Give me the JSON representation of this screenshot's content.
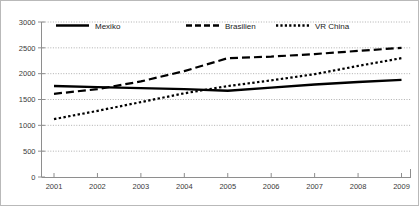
{
  "chart_data": {
    "type": "line",
    "title": "",
    "xlabel": "",
    "ylabel": "",
    "categories": [
      "2001",
      "2002",
      "2003",
      "2004",
      "2005",
      "2006",
      "2007",
      "2008",
      "2009"
    ],
    "x_tick_labels": [
      "2001",
      "2002",
      "2003",
      "2004",
      "2005",
      "2006",
      "2007",
      "2008",
      "2009"
    ],
    "y_tick_labels": [
      "0",
      "500",
      "1000",
      "1500",
      "2000",
      "2500",
      "3000"
    ],
    "y_ticks": [
      0,
      500,
      1000,
      1500,
      2000,
      2500,
      3000
    ],
    "ylim": [
      0,
      3000
    ],
    "grid": "horizontal-dotted",
    "legend_position": "top-inside",
    "series": [
      {
        "name": "Mexiko",
        "style": "solid",
        "values": [
          1760,
          1740,
          1720,
          1700,
          1670,
          1730,
          1790,
          1840,
          1880
        ]
      },
      {
        "name": "Brasilien",
        "style": "dashed",
        "values": [
          1610,
          1700,
          1850,
          2050,
          2300,
          2330,
          2380,
          2440,
          2500
        ]
      },
      {
        "name": "VR China",
        "style": "dotted",
        "values": [
          1120,
          1280,
          1450,
          1620,
          1760,
          1870,
          1990,
          2150,
          2300
        ]
      }
    ]
  },
  "legend": {
    "items": [
      {
        "label": "Mexiko"
      },
      {
        "label": "Brasilien"
      },
      {
        "label": "VR China"
      }
    ]
  },
  "top_note": ""
}
